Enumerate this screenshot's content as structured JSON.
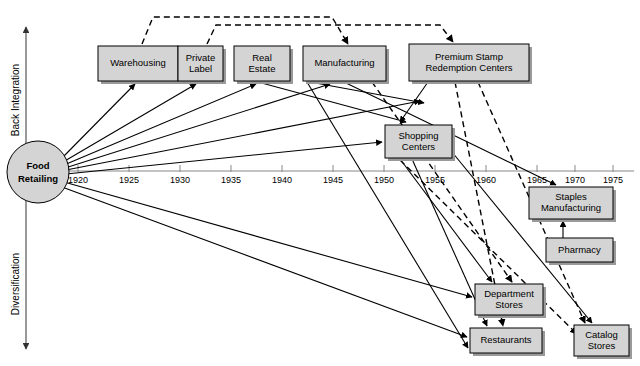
{
  "figure": {
    "title_fragment": "",
    "hub": {
      "label_line1": "Food",
      "label_line2": "Retailing",
      "cx": 38,
      "cy": 172,
      "r": 31
    },
    "vertical_axis": {
      "up_label": "Back Integration",
      "down_label": "Diversification",
      "x": 26,
      "top_y": 24,
      "bottom_y": 352
    },
    "time_axis": {
      "x_start": 63,
      "x_end": 634,
      "y": 171,
      "ticks": [
        {
          "label": "1920",
          "x": 78
        },
        {
          "label": "1925",
          "x": 129
        },
        {
          "label": "1930",
          "x": 180
        },
        {
          "label": "1935",
          "x": 231
        },
        {
          "label": "1940",
          "x": 282
        },
        {
          "label": "1945",
          "x": 333
        },
        {
          "label": "1950",
          "x": 384
        },
        {
          "label": "1955",
          "x": 435
        },
        {
          "label": "1960",
          "x": 486
        },
        {
          "label": "1965",
          "x": 537
        },
        {
          "label": "1970",
          "x": 575
        },
        {
          "label": "1975",
          "x": 613
        }
      ]
    },
    "nodes": [
      {
        "id": "warehousing",
        "name": "warehousing",
        "lines": [
          "Warehousing"
        ],
        "x": 98,
        "y": 46,
        "w": 80,
        "h": 35
      },
      {
        "id": "private-label",
        "name": "private-label",
        "lines": [
          "Private",
          "Label"
        ],
        "x": 178,
        "y": 46,
        "w": 45,
        "h": 35
      },
      {
        "id": "real-estate",
        "name": "real-estate",
        "lines": [
          "Real",
          "Estate"
        ],
        "x": 234,
        "y": 46,
        "w": 56,
        "h": 35
      },
      {
        "id": "manufacturing",
        "name": "manufacturing",
        "lines": [
          "Manufacturing"
        ],
        "x": 303,
        "y": 46,
        "w": 83,
        "h": 35
      },
      {
        "id": "premium-stamp",
        "name": "premium-stamp-redemption-centers",
        "lines": [
          "Premium Stamp",
          "Redemption Centers"
        ],
        "x": 409,
        "y": 44,
        "w": 120,
        "h": 37
      },
      {
        "id": "shopping-centers",
        "name": "shopping-centers",
        "lines": [
          "Shopping",
          "Centers"
        ],
        "x": 385,
        "y": 125,
        "w": 67,
        "h": 33
      },
      {
        "id": "staples-manufacturing",
        "name": "staples-manufacturing",
        "lines": [
          "Staples",
          "Manufacturing"
        ],
        "x": 529,
        "y": 187,
        "w": 84,
        "h": 32
      },
      {
        "id": "pharmacy",
        "name": "pharmacy",
        "lines": [
          "Pharmacy"
        ],
        "x": 546,
        "y": 238,
        "w": 67,
        "h": 24
      },
      {
        "id": "department-stores",
        "name": "department-stores",
        "lines": [
          "Department",
          "Stores"
        ],
        "x": 475,
        "y": 284,
        "w": 68,
        "h": 31
      },
      {
        "id": "restaurants",
        "name": "restaurants",
        "lines": [
          "Restaurants"
        ],
        "x": 470,
        "y": 328,
        "w": 72,
        "h": 25
      },
      {
        "id": "catalog-stores",
        "name": "catalog-stores",
        "lines": [
          "Catalog",
          "Stores"
        ],
        "x": 574,
        "y": 325,
        "w": 55,
        "h": 31
      }
    ],
    "links_solid": [
      {
        "from": "food-retailing",
        "to": "warehousing",
        "d": "M 62 158 L 135 84"
      },
      {
        "from": "food-retailing",
        "to": "private-label",
        "d": "M 63 162 L 196 84"
      },
      {
        "from": "food-retailing",
        "to": "real-estate",
        "d": "M 64 165 L 256 84"
      },
      {
        "from": "food-retailing",
        "to": "manufacturing",
        "d": "M 65 168 L 330 84"
      },
      {
        "from": "food-retailing",
        "to": "premium-stamp",
        "d": "M 66 170 L 420 101"
      },
      {
        "from": "food-retailing",
        "to": "shopping-centers",
        "d": "M 66 174 L 382 142"
      },
      {
        "from": "food-retailing",
        "to": "department-stores",
        "d": "M 64 182 L 472 297"
      },
      {
        "from": "food-retailing",
        "to": "restaurants",
        "d": "M 62 187 L 467 337"
      },
      {
        "from": "real-estate",
        "to": "shopping-centers",
        "d": "M 258 82 L 406 122"
      },
      {
        "from": "manufacturing",
        "to": "premium-stamp",
        "d": "M 310 82 L 424 103"
      },
      {
        "from": "premium-stamp",
        "to": "shopping-centers",
        "d": "M 428 82 L 400 122"
      },
      {
        "from": "manufacturing",
        "to": "staples-manufacturing",
        "d": "M 344 82 L 556 185"
      },
      {
        "from": "shopping-centers",
        "to": "department-stores",
        "d": "M 400 159 L 492 282"
      },
      {
        "from": "shopping-centers",
        "to": "restaurants",
        "d": "M 412 159 L 487 326"
      },
      {
        "from": "shopping-centers",
        "to": "catalog-stores",
        "d": "M 452 152 L 592 323"
      },
      {
        "from": "pharmacy",
        "to": "staples-manufacturing",
        "d": "M 563 238 L 563 221"
      },
      {
        "from": "manufacturing",
        "to": "restaurants",
        "d": "M 307 82 L 468 348"
      }
    ],
    "links_dashed": [
      {
        "from": "warehousing",
        "to": "manufacturing-top",
        "d": "M 142 44 L 153 17 L 332 17 L 348 44"
      },
      {
        "from": "private-label",
        "to": "premium-stamp-top",
        "d": "M 207 44 L 216 25 L 440 25 L 453 42"
      },
      {
        "from": "manufacturing",
        "to": "department-stores",
        "d": "M 372 82 L 512 282"
      },
      {
        "from": "premium-stamp",
        "to": "restaurants",
        "d": "M 455 82 L 503 326"
      },
      {
        "from": "premium-stamp",
        "to": "catalog-stores",
        "d": "M 478 82 L 585 323"
      },
      {
        "from": "shopping-centers",
        "to": "catalog-stores-2",
        "d": "M 400 160 L 577 334"
      }
    ],
    "colors": {
      "box_fill": "#d4d4d4",
      "box_stroke": "#000000",
      "shadow": "#9a9a9a",
      "axis": "#888888",
      "line": "#000000",
      "background": "#ffffff"
    }
  }
}
